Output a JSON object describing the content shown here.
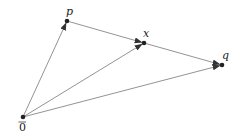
{
  "diagram": {
    "type": "vector-diagram",
    "points": [
      {
        "id": "origin",
        "label": "0",
        "overline": true,
        "x": 23,
        "y": 117,
        "lx": 19,
        "ly": 131
      },
      {
        "id": "p",
        "label": "p",
        "x": 67,
        "y": 21,
        "lx": 66,
        "ly": 15
      },
      {
        "id": "x",
        "label": "x",
        "x": 144,
        "y": 43,
        "lx": 143,
        "ly": 37
      },
      {
        "id": "q",
        "label": "q",
        "x": 222,
        "y": 65,
        "lx": 222,
        "ly": 59
      }
    ],
    "arrows": [
      {
        "from": "origin",
        "to": "p"
      },
      {
        "from": "origin",
        "to": "x"
      },
      {
        "from": "origin",
        "to": "q"
      },
      {
        "from": "p",
        "to": "q",
        "through": "x"
      }
    ],
    "colors": {
      "line": "#777777",
      "point": "#222222"
    }
  }
}
